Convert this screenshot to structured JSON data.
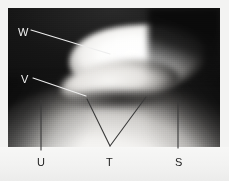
{
  "figure": {
    "kind": "grayscale-radiographic-image",
    "width": 229,
    "height": 181,
    "background_color": "#f3f3f2",
    "plate": {
      "dark_field_color": "#131313",
      "bright_structure_color": "#fdfdfc",
      "mid_gray_color": "#9b9996"
    },
    "margin_band_color": "#f2f2f1"
  },
  "annotations": {
    "label_light_color": "#f2f2f2",
    "label_dark_color": "#232323",
    "leader_light_color": "#ededed",
    "leader_dark_color": "#3a3a3a",
    "items": [
      {
        "id": "W",
        "label": "W",
        "label_style": "light",
        "label_x": 18,
        "label_y": 27,
        "leader": "single-oblique",
        "leader_from_x": 31,
        "leader_from_y": 30,
        "leader_to_x": 110,
        "leader_to_y": 54
      },
      {
        "id": "V",
        "label": "V",
        "label_style": "light",
        "label_x": 21,
        "label_y": 74,
        "leader": "single-oblique",
        "leader_from_x": 33,
        "leader_from_y": 78,
        "leader_to_x": 86,
        "leader_to_y": 96
      },
      {
        "id": "U",
        "label": "U",
        "label_style": "dark",
        "label_x": 37,
        "label_y": 157,
        "leader": "vertical",
        "leader_from_x": 41,
        "leader_from_y": 100,
        "leader_to_x": 41,
        "leader_to_y": 150
      },
      {
        "id": "T",
        "label": "T",
        "label_style": "dark",
        "label_x": 106,
        "label_y": 157,
        "leader": "v-shaped",
        "apex_x": 110,
        "apex_y": 146,
        "left_arm_x": 87,
        "left_arm_y": 99,
        "right_arm_x": 146,
        "right_arm_y": 97
      },
      {
        "id": "S",
        "label": "S",
        "label_style": "dark",
        "label_x": 175,
        "label_y": 157,
        "leader": "vertical",
        "leader_from_x": 178,
        "leader_from_y": 101,
        "leader_to_x": 178,
        "leader_to_y": 148
      }
    ]
  }
}
